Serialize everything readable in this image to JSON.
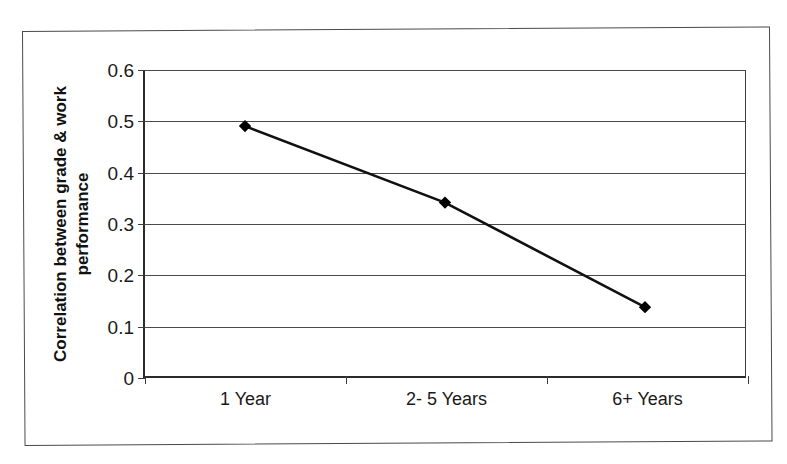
{
  "chart_data": {
    "type": "line",
    "title": "",
    "subtitle": "",
    "xlabel": "",
    "ylabel": "Correlation between grade & work performance",
    "ylabel_line1": "Correlation between grade & work",
    "ylabel_line2": "performance",
    "categories": [
      "1 Year",
      "2- 5 Years",
      "6+ Years"
    ],
    "values": [
      0.49,
      0.34,
      0.135
    ],
    "series": [
      {
        "name": "Correlation between grade & work performance",
        "values": [
          0.49,
          0.34,
          0.135
        ]
      }
    ],
    "ylim": [
      0,
      0.6
    ],
    "y_ticks": [
      "0.6",
      "0.5",
      "0.4",
      "0.3",
      "0.2",
      "0.1",
      "0"
    ],
    "y_tick_values": [
      0.6,
      0.5,
      0.4,
      0.3,
      0.2,
      0.1,
      0
    ],
    "grid": true,
    "grid_axis": "y",
    "legend": false,
    "legend_position": "none",
    "marker": "filled-diamond",
    "marker_color": "#000000",
    "line_color": "#111111",
    "plot_background": "#ffffff",
    "frame_color": "#4a4a4a",
    "axis_color": "#2b2b2b"
  }
}
